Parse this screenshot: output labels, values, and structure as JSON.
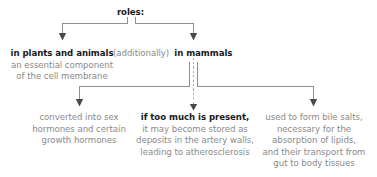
{
  "diagram": {
    "type": "tree-flowchart",
    "title_node": {
      "text": "roles:",
      "style": "bold"
    },
    "level1": [
      {
        "id": "plants-and-animals",
        "heading": "in plants and animals",
        "body_lines": [
          "an essential component",
          "of the cell membrane"
        ]
      },
      {
        "id": "mammals",
        "prefix": "(additionally)",
        "heading": "in mammals",
        "body_lines": []
      }
    ],
    "level2": [
      {
        "id": "sex-hormones",
        "heading": "",
        "body_lines": [
          "converted into sex",
          "hormones and certain",
          "growth hormones"
        ]
      },
      {
        "id": "atherosclerosis",
        "heading": "if too much is present,",
        "body_lines": [
          "it may become stored as",
          "deposits in the artery walls,",
          "leading to atherosclerosis"
        ]
      },
      {
        "id": "bile-salts",
        "heading": "",
        "body_lines": [
          "used to form bile salts,",
          "necessary for the",
          "absorption of lipids,",
          "and their transport from",
          "gut to body tissues"
        ]
      }
    ],
    "colors": {
      "heading_text": "#1a1a1a",
      "body_text": "#8a8a8a",
      "connector": "#8f8f8f",
      "background": "#ffffff"
    }
  }
}
